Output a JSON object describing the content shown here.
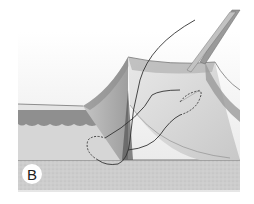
{
  "figure": {
    "panel_label": "B",
    "colors": {
      "background": "#ffffff",
      "ground": "#c9c9c9",
      "epidermis": "#dcdcdc",
      "dermis_band": "#8f8f8f",
      "subcutis": "#d4d4d4",
      "flap_inner": "#bdbdbd",
      "thread": "#333333",
      "forceps": "#9a9a9a"
    }
  }
}
